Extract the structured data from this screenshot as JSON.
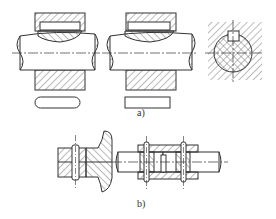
{
  "figure": {
    "subfigures": [
      {
        "id": "a",
        "label": "a)",
        "description": "Key connections: feather/sunk key in shaft-hub joint (rounded-end key and square-end key) with cross section"
      },
      {
        "id": "b",
        "label": "b)",
        "description": "Pin connections: pin through flange/plate and pins securing sleeve coupling on shafts"
      }
    ],
    "colors": {
      "line": "#333333",
      "hatch": "#555555",
      "background": "#ffffff"
    }
  }
}
